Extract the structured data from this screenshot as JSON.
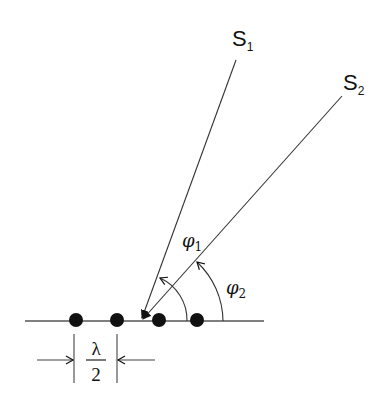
{
  "diagram": {
    "type": "antenna-array-geometry",
    "sources": [
      {
        "id": "S1",
        "label": "S",
        "subscript": "1",
        "ray_start": [
          236,
          60
        ],
        "ray_end": [
          141,
          321
        ]
      },
      {
        "id": "S2",
        "label": "S",
        "subscript": "2",
        "ray_start": [
          342,
          96
        ],
        "ray_end": [
          141,
          321
        ]
      }
    ],
    "angles": [
      {
        "symbol": "φ",
        "subscript": "1",
        "radius": 46
      },
      {
        "symbol": "φ",
        "subscript": "2",
        "radius": 82
      }
    ],
    "array": {
      "baseline": {
        "x1": 25,
        "x2": 264,
        "y": 321
      },
      "elements": [
        76,
        117,
        159,
        197
      ],
      "element_count": 4
    },
    "spacing": {
      "numerator": "λ",
      "denominator": "2"
    },
    "colors": {
      "stroke": "#222222",
      "element": "#111111",
      "background": "#ffffff"
    }
  }
}
